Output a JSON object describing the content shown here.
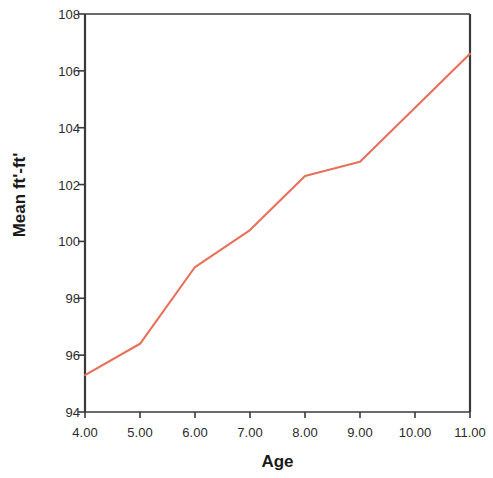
{
  "chart_data": {
    "type": "line",
    "title": "",
    "xlabel": "Age",
    "ylabel": "Mean ft'-ft'",
    "x": [
      4.0,
      5.0,
      6.0,
      7.0,
      8.0,
      9.0,
      10.0,
      11.0
    ],
    "values": [
      95.3,
      96.4,
      99.1,
      100.4,
      102.3,
      102.8,
      104.7,
      106.6
    ],
    "series": [
      {
        "name": "Mean ft'-ft'",
        "values": [
          95.3,
          96.4,
          99.1,
          100.4,
          102.3,
          102.8,
          104.7,
          106.6
        ]
      }
    ],
    "xtick_labels": [
      "4.00",
      "5.00",
      "6.00",
      "7.00",
      "8.00",
      "9.00",
      "10.00",
      "11.00"
    ],
    "ytick_labels": [
      "94",
      "96",
      "98",
      "100",
      "102",
      "104",
      "106",
      "108"
    ],
    "ytick_values": [
      94,
      96,
      98,
      100,
      102,
      104,
      106,
      108
    ],
    "xlim": [
      4.0,
      11.0
    ],
    "ylim": [
      94,
      108
    ],
    "grid": false,
    "legend": false,
    "line_color": "#e8705a",
    "axis_color": "#3a3a3a",
    "background": "#ffffff"
  }
}
